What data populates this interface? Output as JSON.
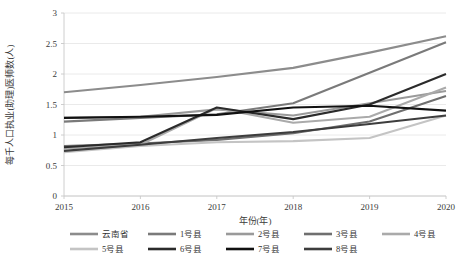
{
  "chart_data": {
    "type": "line",
    "title": "",
    "xlabel": "年份(年)",
    "ylabel": "每千人口执业(助理)医师数(人)",
    "x": [
      "2015",
      "2016",
      "2017",
      "2018",
      "2019",
      "2020"
    ],
    "xtick_labels": [
      "2015",
      "2016",
      "2017",
      "2018",
      "2019",
      "2020"
    ],
    "ytick_labels": [
      "0",
      "0.5",
      "1",
      "1.5",
      "2",
      "2.5",
      "3"
    ],
    "ytick_values": [
      0,
      0.5,
      1,
      1.5,
      2,
      2.5,
      3
    ],
    "ylim": [
      0,
      3
    ],
    "grid": "horizontal",
    "legend_position": "bottom",
    "series": [
      {
        "name": "云南省",
        "color": "#8c8c8c",
        "values": [
          1.7,
          1.82,
          1.95,
          2.1,
          2.35,
          2.62
        ]
      },
      {
        "name": "1号县",
        "color": "#7a7a7a",
        "values": [
          1.22,
          1.28,
          1.34,
          1.52,
          2.02,
          2.52
        ]
      },
      {
        "name": "2号县",
        "color": "#9a9a9a",
        "values": [
          1.28,
          1.3,
          1.42,
          1.32,
          1.52,
          1.72
        ]
      },
      {
        "name": "3号县",
        "color": "#6f6f6f",
        "values": [
          0.82,
          0.86,
          0.92,
          1.03,
          1.22,
          1.64
        ]
      },
      {
        "name": "4号县",
        "color": "#aaaaaa",
        "values": [
          0.78,
          0.84,
          1.44,
          1.2,
          1.3,
          1.78
        ]
      },
      {
        "name": "5号县",
        "color": "#c4c4c4",
        "values": [
          0.72,
          0.82,
          0.88,
          0.9,
          0.95,
          1.32
        ]
      },
      {
        "name": "6号县",
        "color": "#2b2b2b",
        "values": [
          0.8,
          0.88,
          1.45,
          1.26,
          1.5,
          2.0
        ]
      },
      {
        "name": "7号县",
        "color": "#111111",
        "values": [
          1.28,
          1.3,
          1.33,
          1.45,
          1.48,
          1.4
        ]
      },
      {
        "name": "8号县",
        "color": "#3d3d3d",
        "values": [
          0.74,
          0.84,
          0.95,
          1.05,
          1.18,
          1.32
        ]
      }
    ]
  },
  "legend": {
    "rows": [
      [
        "云南省",
        "1号县",
        "2号县",
        "3号县",
        "4号县"
      ],
      [
        "5号县",
        "6号县",
        "7号县",
        "8号县"
      ]
    ]
  }
}
